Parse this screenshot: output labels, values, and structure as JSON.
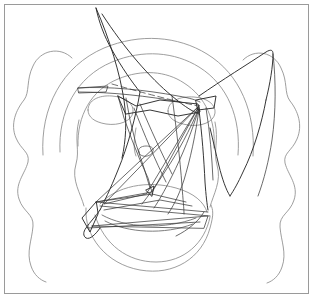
{
  "artwork": {
    "title": "Abstract face line drawing",
    "subject": "stylized primate face with cloud-shaped hair outline",
    "medium": "single-color line sketch",
    "canvas": {
      "width": 313,
      "height": 298,
      "background_color": "#ffffff"
    },
    "frame": {
      "present": true,
      "color": "#9a9a9a",
      "stroke_width": 1
    },
    "palette": {
      "light_line": "#8d8d8d",
      "mid_line": "#6e6e6e",
      "dark_line": "#2b2b2b",
      "background": "#ffffff"
    },
    "layers": [
      {
        "id": "hair-outline",
        "label": "cloud hair outline",
        "tone": "light"
      },
      {
        "id": "head-arcs",
        "label": "concentric head arcs",
        "tone": "light"
      },
      {
        "id": "facial-features",
        "label": "eyes nose mouth chin",
        "tone": "light"
      },
      {
        "id": "overdrawn-polylines",
        "label": "angular overdrawn polylines",
        "tone": "dark"
      }
    ]
  },
  "paths": {
    "hair_outline": "M 72 58 C 60 46 40 50 33 66 C 26 80 30 92 24 100 C 16 110 10 124 16 138 C 21 150 30 152 28 162 C 25 174 14 184 19 199 C 23 212 34 214 33 226 C 32 240 26 252 31 266 C 34 275 40 280 46 282",
    "hair_outline_right": "M 243 60 C 255 48 274 52 281 68 C 288 82 284 93 290 101 C 298 111 303 125 297 139 C 292 151 283 153 285 163 C 288 175 299 185 294 200 C 290 213 279 215 280 227 C 281 241 287 253 282 267 C 279 276 273 281 267 283",
    "head_outer_arc": "M 43 155 C 40 108 62 66 104 48 C 140 33 178 36 207 54 C 240 74 256 113 253 156",
    "head_inner_arc": "M 60 152 C 58 112 76 77 112 62 C 143 49 175 52 199 67 C 228 85 241 118 238 155",
    "head_inner_arc2": "M 78 146 C 77 116 91 90 118 79 C 142 69 166 71 184 83 C 206 97 216 121 214 148",
    "face_left_cheek": "M 79 120 C 74 140 80 150 76 164 C 71 180 81 194 84 206",
    "face_right_cheek": "M 215 122 C 219 141 213 151 217 165 C 222 181 213 195 210 207",
    "chin_outline": "M 86 208 C 84 236 106 264 140 270 C 174 276 202 258 210 228 C 214 214 213 210 211 205",
    "jaw_lower": "M 95 215 C 104 245 128 262 156 262 C 184 262 205 243 210 217",
    "muzzle_arc": "M 100 204 C 116 186 148 180 176 188 C 194 193 204 202 207 212",
    "mouth_line": "M 102 215 C 125 228 165 230 196 218",
    "mouth_line2": "M 105 221 C 128 233 164 235 193 224",
    "eye_left": "M 88 110 C 88 100 99 95 112 96 C 126 97 134 104 133 112 C 132 121 119 126 106 124 C 94 122 88 117 88 110 Z",
    "eye_right": "M 168 111 C 168 101 180 96 194 97 C 208 98 216 105 215 113 C 214 122 201 127 188 125 C 175 123 168 118 168 111 Z",
    "nose_oval": "M 139 152 C 137 149 141 146 146 146 C 151 146 154 148 153 151 C 152 155 147 157 143 156 C 140 155 139 154 139 152 Z",
    "nose_bridge": "M 136 128 C 134 140 133 148 136 156",
    "dark_peak_left": "M 96 8 C 99 22 104 36 112 50 C 122 68 132 82 140 92",
    "dark_long_sweep": "M 96 8 C 110 40 120 74 124 100 C 127 122 126 140 122 158",
    "dark_curve_down_left": "M 140 92 C 136 116 128 146 118 170 C 110 190 104 202 100 210",
    "dark_left_tail": "M 100 210 C 96 216 90 222 86 228 C 83 232 83 236 86 238 C 90 240 96 234 100 228",
    "dark_big_diagonal": "M 102 14 C 124 48 150 78 172 96 C 186 108 194 112 199 114",
    "dark_right_wing": "M 199 96 C 222 80 248 64 266 52 C 271 49 273 50 273 54 C 273 66 270 84 266 100",
    "dark_right_wing_lower": "M 266 100 C 262 122 254 150 243 172 C 238 183 234 190 230 196",
    "dark_right_V": "M 230 196 C 226 190 222 178 219 166 C 216 154 213 140 210 128",
    "dark_right_edge": "M 273 54 C 276 80 276 112 272 140 C 269 160 264 180 258 196",
    "dark_dashed_diag": "M 112 84 C 140 92 170 100 198 106",
    "dark_brow_line": "M 78 88 C 108 86 146 90 178 96 C 190 98 196 100 200 102",
    "dark_brow_line2": "M 79 92 C 110 92 148 96 180 102",
    "dark_brow_flat": "M 78 88 L 108 86 L 106 92 L 79 93 Z",
    "poly_main": "M 118 96 L 136 106 L 160 100 L 198 104 L 200 112 L 178 116 L 150 110 L 126 114 Z",
    "poly_center_left": "M 118 96 L 124 118 L 132 140 L 140 160 L 148 178 L 152 192",
    "poly_center_left2": "M 126 98 L 130 120 L 136 144 L 144 168 L 150 188",
    "dark_tri_big": "M 199 106 L 96 202 L 152 192 Z",
    "dark_tri_big2": "M 199 106 L 104 204 L 146 194 Z",
    "dark_vert_right": "M 199 110 C 202 134 204 160 205 182 C 206 196 207 204 208 210",
    "dark_vert_right2": "M 206 108 C 210 132 212 158 213 180",
    "dark_fan_1": "M 199 108 C 190 130 178 152 166 170 C 156 186 148 196 142 204",
    "dark_fan_2": "M 199 108 C 192 132 182 156 172 176 C 164 192 158 202 154 208",
    "dark_fan_3": "M 199 108 C 196 134 190 160 184 180 C 178 198 172 208 168 214",
    "dark_bottom_band": "M 96 202 L 208 212",
    "dark_bottom_band2": "M 100 206 L 210 216",
    "dark_bottom_tri": "M 92 226 L 208 216 L 204 228 Z",
    "dark_bottom_tri2": "M 88 228 L 200 222",
    "dark_left_blade": "M 96 202 L 82 218 L 90 232 L 98 214 Z",
    "dark_cross_1": "M 96 202 L 152 194 L 186 202",
    "dark_cross_2": "M 104 210 L 160 200 L 192 206",
    "dark_small_arrow": "M 146 190 L 154 186 L 152 196 Z",
    "dark_right_flag": "M 196 100 L 216 96 L 214 108 L 198 110 Z",
    "dark_thin_ray_1": "M 140 104 C 150 128 162 154 172 174",
    "dark_thin_ray_2": "M 134 108 C 144 134 156 162 166 182",
    "dark_under_chin": "M 204 212 C 198 222 188 230 176 236",
    "dark_vertical_long": "M 172 96 C 176 126 180 158 182 186 C 183 200 184 208 184 214"
  },
  "features": {
    "eye_count": 2,
    "eye_shape": "ellipse",
    "nose_shape": "small ellipse",
    "mouth_shape": "curved band",
    "hair_shape": "scalloped cloud",
    "head_arc_count": 3
  }
}
